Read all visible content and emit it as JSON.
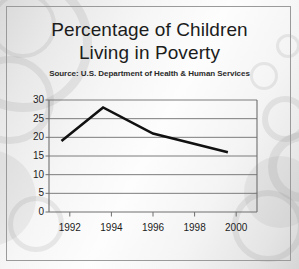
{
  "figure": {
    "title_lines": [
      "Percentage of Children",
      "Living in Poverty"
    ],
    "source": "Source: U.S. Department of Health & Human Services",
    "frame_color": "#9a9a9a",
    "line_color": "#111111",
    "grid_color": "#6e6e6e",
    "background_color": "#f2f2f2"
  },
  "chart_data": {
    "type": "line",
    "title": "Percentage of Children Living in Poverty",
    "subtitle": "Source: U.S. Department of Health & Human Services",
    "xlabel": "",
    "ylabel": "",
    "xlim": [
      1991,
      2001
    ],
    "ylim": [
      0,
      30
    ],
    "ytick_labels": [
      "0",
      "5",
      "10",
      "15",
      "20",
      "25",
      "30"
    ],
    "yticks": [
      0,
      5,
      10,
      15,
      20,
      25,
      30
    ],
    "xtick_labels": [
      "1992",
      "1994",
      "1996",
      "1998",
      "2000"
    ],
    "xticks": [
      1992,
      1994,
      1996,
      1998,
      2000
    ],
    "grid": "horizontal",
    "legend": "none",
    "series": [
      {
        "name": "Percentage of children living in poverty",
        "x": [
          1991.6,
          1993.6,
          1996.0,
          1999.6
        ],
        "values": [
          19,
          28,
          21,
          16
        ]
      }
    ]
  }
}
